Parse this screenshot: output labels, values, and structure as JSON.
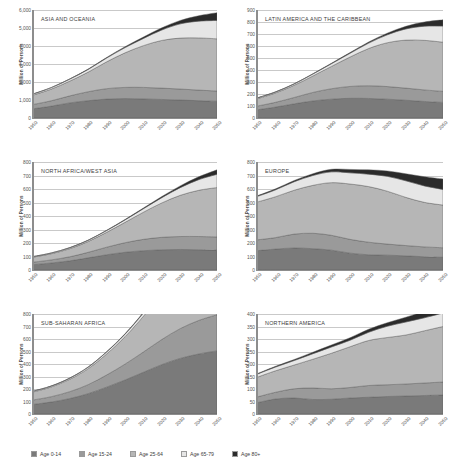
{
  "figure": {
    "ylabel": "Million of Persons",
    "xtick_labels": [
      "1950",
      "1960",
      "1970",
      "1980",
      "1990",
      "2000",
      "2010",
      "2020",
      "2030",
      "2040",
      "2050"
    ]
  },
  "legend": {
    "position": "bottom",
    "items": [
      {
        "label": "Age 0-14",
        "color": "#7a7a7a",
        "key": "age_0_14"
      },
      {
        "label": "Age 15-24",
        "color": "#9a9a9a",
        "key": "age_15_24"
      },
      {
        "label": "Age 25-64",
        "color": "#b6b6b6",
        "key": "age_25_64"
      },
      {
        "label": "Age 65-79",
        "color": "#e6e6e6",
        "key": "age_65_79"
      },
      {
        "label": "Age 80+",
        "color": "#2b2b2b",
        "key": "age_80_plus"
      }
    ]
  },
  "chart_data": [
    {
      "type": "area",
      "id": "asia-and-oceania",
      "title": "ASIA AND OCEANIA",
      "xlabel": "",
      "ylabel": "Million of Persons",
      "x": [
        1950,
        1960,
        1970,
        1980,
        1990,
        2000,
        2010,
        2020,
        2030,
        2040,
        2050
      ],
      "ylim": [
        0,
        6000
      ],
      "yticks": [
        0,
        1000,
        2000,
        3000,
        4000,
        5000,
        6000
      ],
      "ytick_labels": [
        "0",
        "1,000",
        "2,000",
        "3,000",
        "4,000",
        "5,000",
        "6,000"
      ],
      "grid": true,
      "stacked": true,
      "series": [
        {
          "name": "Age 0-14",
          "values": [
            510,
            660,
            840,
            960,
            1050,
            1080,
            1060,
            1030,
            1000,
            960,
            930
          ]
        },
        {
          "name": "Age 15-24",
          "values": [
            240,
            300,
            390,
            500,
            580,
            620,
            640,
            630,
            610,
            590,
            570
          ]
        },
        {
          "name": "Age 25-64",
          "values": [
            520,
            650,
            820,
            1090,
            1490,
            1920,
            2320,
            2650,
            2830,
            2900,
            2900
          ]
        },
        {
          "name": "Age 65-79",
          "values": [
            60,
            80,
            110,
            150,
            210,
            290,
            400,
            580,
            790,
            930,
            1020
          ]
        },
        {
          "name": "Age 80+",
          "values": [
            8,
            11,
            15,
            22,
            33,
            50,
            78,
            120,
            190,
            300,
            430
          ]
        }
      ]
    },
    {
      "type": "area",
      "id": "latin-america-and-the-caribbean",
      "title": "LATIN AMERICA AND THE CARIBBEAN",
      "xlabel": "",
      "ylabel": "Million of Persons",
      "x": [
        1950,
        1960,
        1970,
        1980,
        1990,
        2000,
        2010,
        2020,
        2030,
        2040,
        2050
      ],
      "ylim": [
        0,
        900
      ],
      "yticks": [
        0,
        100,
        200,
        300,
        400,
        500,
        600,
        700,
        800,
        900
      ],
      "ytick_labels": [
        "0",
        "100",
        "200",
        "300",
        "400",
        "500",
        "600",
        "700",
        "800",
        "900"
      ],
      "grid": true,
      "stacked": true,
      "series": [
        {
          "name": "Age 0-14",
          "values": [
            68,
            91,
            118,
            142,
            157,
            164,
            163,
            157,
            148,
            138,
            130
          ]
        },
        {
          "name": "Age 15-24",
          "values": [
            31,
            40,
            53,
            71,
            87,
            99,
            106,
            105,
            101,
            96,
            92
          ]
        },
        {
          "name": "Age 25-64",
          "values": [
            61,
            78,
            102,
            137,
            186,
            245,
            310,
            365,
            400,
            413,
            410
          ]
        },
        {
          "name": "Age 65-79",
          "values": [
            6,
            8,
            11,
            16,
            22,
            31,
            45,
            66,
            93,
            118,
            134
          ]
        },
        {
          "name": "Age 80+",
          "values": [
            1,
            1.3,
            1.8,
            2.6,
            4,
            6,
            9,
            14,
            22,
            35,
            52
          ]
        }
      ]
    },
    {
      "type": "area",
      "id": "north-africa-west-asia",
      "title": "NORTH AFRICA/WEST ASIA",
      "xlabel": "",
      "ylabel": "Million of Persons",
      "x": [
        1950,
        1960,
        1970,
        1980,
        1990,
        2000,
        2010,
        2020,
        2030,
        2040,
        2050
      ],
      "ylim": [
        0,
        800
      ],
      "yticks": [
        0,
        100,
        200,
        300,
        400,
        500,
        600,
        700,
        800
      ],
      "ytick_labels": [
        "0",
        "100",
        "200",
        "300",
        "400",
        "500",
        "600",
        "700",
        "800"
      ],
      "grid": true,
      "stacked": true,
      "series": [
        {
          "name": "Age 0-14",
          "values": [
            40,
            52,
            68,
            90,
            113,
            131,
            143,
            150,
            152,
            150,
            147
          ]
        },
        {
          "name": "Age 15-24",
          "values": [
            18,
            23,
            30,
            41,
            56,
            71,
            84,
            92,
            96,
            98,
            98
          ]
        },
        {
          "name": "Age 25-64",
          "values": [
            37,
            46,
            60,
            80,
            110,
            151,
            201,
            255,
            305,
            342,
            366
          ]
        },
        {
          "name": "Age 65-79",
          "values": [
            4,
            5,
            7,
            9,
            13,
            18,
            26,
            39,
            57,
            79,
            98
          ]
        },
        {
          "name": "Age 80+",
          "values": [
            0.6,
            0.8,
            1.1,
            1.6,
            2.3,
            3.4,
            5,
            8,
            13,
            21,
            33
          ]
        }
      ]
    },
    {
      "type": "area",
      "id": "europe",
      "title": "EUROPE",
      "xlabel": "",
      "ylabel": "Million of Persons",
      "x": [
        1950,
        1960,
        1970,
        1980,
        1990,
        2000,
        2010,
        2020,
        2030,
        2040,
        2050
      ],
      "ylim": [
        0,
        800
      ],
      "yticks": [
        0,
        100,
        200,
        300,
        400,
        500,
        600,
        700,
        800
      ],
      "ytick_labels": [
        "0",
        "100",
        "200",
        "300",
        "400",
        "500",
        "600",
        "700",
        "800"
      ],
      "grid": true,
      "stacked": true,
      "series": [
        {
          "name": "Age 0-14",
          "values": [
            143,
            155,
            163,
            158,
            147,
            125,
            113,
            110,
            105,
            98,
            94
          ]
        },
        {
          "name": "Age 15-24",
          "values": [
            80,
            85,
            103,
            114,
            110,
            102,
            93,
            82,
            76,
            73,
            71
          ]
        },
        {
          "name": "Age 25-64",
          "values": [
            280,
            303,
            325,
            355,
            390,
            410,
            412,
            392,
            357,
            330,
            316
          ]
        },
        {
          "name": "Age 65-79",
          "values": [
            41,
            51,
            63,
            73,
            80,
            83,
            92,
            110,
            123,
            122,
            116
          ]
        },
        {
          "name": "Age 80+",
          "values": [
            5,
            7,
            9,
            13,
            19,
            25,
            32,
            40,
            52,
            68,
            77
          ]
        }
      ]
    },
    {
      "type": "area",
      "id": "sub-saharan-africa",
      "title": "SUB-SAHARAN AFRICA",
      "xlabel": "",
      "ylabel": "Million of Persons",
      "x": [
        1950,
        1960,
        1970,
        1980,
        1990,
        2000,
        2010,
        2020,
        2030,
        2040,
        2050
      ],
      "ylim": [
        0,
        800
      ],
      "yticks": [
        0,
        100,
        200,
        300,
        400,
        500,
        600,
        700,
        800
      ],
      "ytick_labels": [
        "0",
        "100",
        "200",
        "300",
        "400",
        "500",
        "600",
        "700",
        "800"
      ],
      "grid": true,
      "stacked": true,
      "series": [
        {
          "name": "Age 0-14",
          "values": [
            77,
            96,
            124,
            163,
            215,
            272,
            334,
            395,
            445,
            480,
            505
          ]
        },
        {
          "name": "Age 15-24",
          "values": [
            35,
            43,
            55,
            72,
            97,
            127,
            162,
            201,
            238,
            268,
            289
          ]
        },
        {
          "name": "Age 25-64",
          "values": [
            64,
            78,
            99,
            128,
            168,
            219,
            286,
            371,
            472,
            580,
            685
          ]
        },
        {
          "name": "Age 65-79",
          "values": [
            6,
            7,
            9,
            12,
            16,
            21,
            27,
            36,
            49,
            68,
            94
          ]
        },
        {
          "name": "Age 80+",
          "values": [
            1,
            1.2,
            1.5,
            2,
            2.6,
            3.5,
            4.6,
            6,
            8,
            12,
            18
          ]
        }
      ]
    },
    {
      "type": "area",
      "id": "northern-america",
      "title": "NORTHERN AMERICA",
      "xlabel": "",
      "ylabel": "Million of Persons",
      "x": [
        1950,
        1960,
        1970,
        1980,
        1990,
        2000,
        2010,
        2020,
        2030,
        2040,
        2050
      ],
      "ylim": [
        0,
        400
      ],
      "yticks": [
        0,
        50,
        100,
        150,
        200,
        250,
        300,
        350,
        400
      ],
      "ytick_labels": [
        "0",
        "50",
        "100",
        "150",
        "200",
        "250",
        "300",
        "350",
        "400"
      ],
      "grid": true,
      "stacked": true,
      "series": [
        {
          "name": "Age 0-14",
          "values": [
            45,
            60,
            64,
            58,
            59,
            64,
            67,
            70,
            72,
            74,
            76
          ]
        },
        {
          "name": "Age 15-24",
          "values": [
            23,
            27,
            37,
            46,
            42,
            42,
            47,
            47,
            48,
            50,
            52
          ]
        },
        {
          "name": "Age 25-64",
          "values": [
            79,
            86,
            95,
            115,
            142,
            163,
            180,
            189,
            196,
            209,
            222
          ]
        },
        {
          "name": "Age 65-79",
          "values": [
            12,
            15,
            18,
            22,
            25,
            26,
            33,
            45,
            52,
            52,
            54
          ]
        },
        {
          "name": "Age 80+",
          "values": [
            2,
            3,
            4,
            6,
            8,
            10,
            12,
            14,
            19,
            26,
            32
          ]
        }
      ]
    }
  ]
}
